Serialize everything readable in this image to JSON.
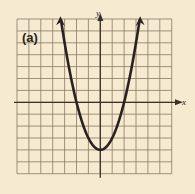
{
  "panel_label": "(a)",
  "axes": {
    "x_label": "x",
    "y_label": "y"
  },
  "colors": {
    "background": "#f6ead0",
    "grid": "#8a7a64",
    "axis": "#3a302a",
    "curve": "#2a2220"
  },
  "chart_data": {
    "type": "line",
    "title": "(a)",
    "xlabel": "x",
    "ylabel": "y",
    "function": "y = x^2 - 4",
    "xlim": [
      -7,
      6
    ],
    "ylim": [
      -6,
      7
    ],
    "grid": true,
    "grid_step": 1,
    "series": [
      {
        "name": "parabola",
        "x": [
          -3.3,
          -3,
          -2,
          -1,
          0,
          1,
          2,
          3,
          3.3
        ],
        "y": [
          6.9,
          5,
          0,
          -3,
          -4,
          -3,
          0,
          5,
          6.9
        ]
      }
    ],
    "vertex": [
      0,
      -4
    ],
    "x_intercepts": [
      -2,
      2
    ],
    "arrows_at_ends": true
  }
}
